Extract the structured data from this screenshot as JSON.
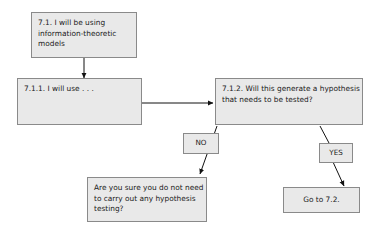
{
  "diagram": {
    "background_color": "#ffffff",
    "node_fill_color": "#e9e9e9",
    "node_border_color": "#8a8a8a",
    "edge_color": "#111111",
    "text_color": "#1a1a1a",
    "nodes": {
      "start": "7.1. I will be using information-theoretic models",
      "method": "7.1.1. I will use . . .",
      "decision": "7.1.2. Will this generate a hypothesis that needs to be tested?",
      "no_label": "NO",
      "yes_label": "YES",
      "no_outcome": "Are you sure you do not need to carry out any hypothesis testing?",
      "yes_outcome": "Go to 7.2."
    }
  }
}
